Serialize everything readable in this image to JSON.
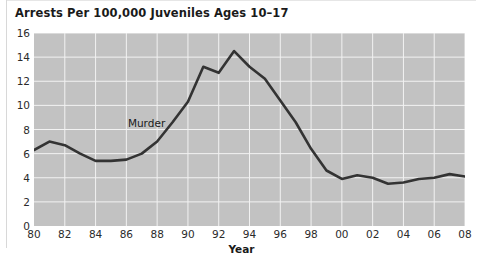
{
  "chart_data": {
    "type": "line",
    "title": "Arrests Per 100,000 Juveniles Ages 10–17",
    "xlabel": "Year",
    "ylabel": "",
    "xlim": [
      1980,
      2008
    ],
    "ylim": [
      0,
      16
    ],
    "grid": true,
    "legend": "none",
    "annotations": [
      {
        "text": "Murder",
        "x": 1987.4,
        "y": 8.55
      }
    ],
    "y_ticks": [
      0,
      2,
      4,
      6,
      8,
      10,
      12,
      14,
      16
    ],
    "y_tick_labels": [
      "0",
      "2",
      "4",
      "6",
      "8",
      "10",
      "12",
      "14",
      "16"
    ],
    "x_ticks": [
      1980,
      1982,
      1984,
      1986,
      1988,
      1990,
      1992,
      1994,
      1996,
      1998,
      2000,
      2002,
      2004,
      2006,
      2008
    ],
    "x_tick_labels": [
      "80",
      "82",
      "84",
      "86",
      "88",
      "90",
      "92",
      "94",
      "96",
      "98",
      "00",
      "02",
      "04",
      "06",
      "08"
    ],
    "series": [
      {
        "name": "Murder",
        "color": "#333333",
        "x": [
          1980,
          1981,
          1982,
          1983,
          1984,
          1985,
          1986,
          1987,
          1988,
          1989,
          1990,
          1991,
          1992,
          1993,
          1994,
          1995,
          1996,
          1997,
          1998,
          1999,
          2000,
          2001,
          2002,
          2003,
          2004,
          2005,
          2006,
          2007,
          2008
        ],
        "values": [
          6.3,
          7.0,
          6.7,
          6.0,
          5.4,
          5.4,
          5.5,
          6.0,
          7.0,
          8.6,
          10.3,
          13.2,
          12.7,
          14.5,
          13.2,
          12.2,
          10.4,
          8.6,
          6.4,
          4.6,
          3.9,
          4.2,
          4.0,
          3.5,
          3.6,
          3.9,
          4.0,
          4.3,
          4.1
        ]
      }
    ]
  },
  "axes": {
    "x_title": "Year"
  }
}
